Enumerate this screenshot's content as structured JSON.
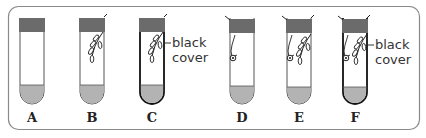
{
  "diagram": {
    "colors": {
      "stopper": "#6b6b6b",
      "liquid": "#b3b3b3",
      "tube_outline": "#555555",
      "black_cover_outline": "#111111",
      "border": "#8a8a8a"
    },
    "tubes": [
      {
        "label": "A",
        "contents": "empty",
        "black_cover": false
      },
      {
        "label": "B",
        "contents": "plant sprig",
        "black_cover": false
      },
      {
        "label": "C",
        "contents": "plant sprig",
        "black_cover": true
      },
      {
        "label": "D",
        "contents": "snail",
        "black_cover": false
      },
      {
        "label": "E",
        "contents": "snail and plant sprig",
        "black_cover": false
      },
      {
        "label": "F",
        "contents": "snail and plant sprig",
        "black_cover": true
      }
    ],
    "annotations": {
      "c_line1": "black",
      "c_line2": "cover",
      "f_line1": "black",
      "f_line2": "cover"
    }
  }
}
